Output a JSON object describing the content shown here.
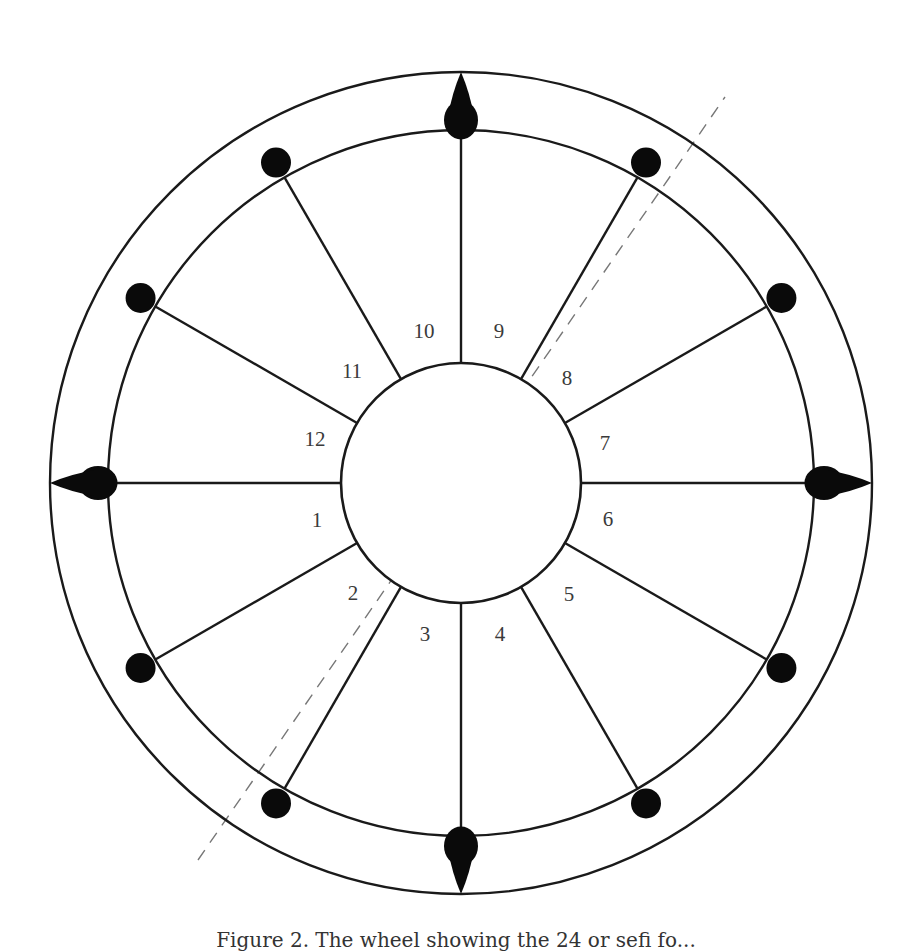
{
  "diagram": {
    "type": "wheel",
    "center": [
      461,
      483
    ],
    "outer_radius": 411,
    "inner_ring_radius": 353,
    "hub_radius": 120,
    "marker_radius": 370,
    "spoke_count": 12,
    "spoke_angles_deg": [
      0,
      30,
      60,
      90,
      120,
      150,
      180,
      210,
      240,
      270,
      300,
      330
    ],
    "line_color": "#1a1a1a",
    "marker_color": "#0a0a0a",
    "dashed_line": {
      "from": [
        198,
        860
      ],
      "to": [
        725,
        97
      ],
      "color": "#777777"
    },
    "cardinal_markers": [
      {
        "name": "top",
        "angle_deg": 90
      },
      {
        "name": "left",
        "angle_deg": 180
      },
      {
        "name": "bottom",
        "angle_deg": 270
      },
      {
        "name": "right",
        "angle_deg": 0
      }
    ],
    "round_markers_angles_deg": [
      30,
      60,
      120,
      150,
      210,
      240,
      300,
      330
    ],
    "houses": [
      {
        "label": "1",
        "pos": [
          317,
          520
        ]
      },
      {
        "label": "2",
        "pos": [
          353,
          593
        ]
      },
      {
        "label": "3",
        "pos": [
          425,
          634
        ]
      },
      {
        "label": "4",
        "pos": [
          500,
          634
        ]
      },
      {
        "label": "5",
        "pos": [
          569,
          594
        ]
      },
      {
        "label": "6",
        "pos": [
          608,
          519
        ]
      },
      {
        "label": "7",
        "pos": [
          605,
          443
        ]
      },
      {
        "label": "8",
        "pos": [
          567,
          378
        ]
      },
      {
        "label": "9",
        "pos": [
          499,
          331
        ]
      },
      {
        "label": "10",
        "pos": [
          424,
          331
        ]
      },
      {
        "label": "11",
        "pos": [
          352,
          371
        ]
      },
      {
        "label": "12",
        "pos": [
          315,
          439
        ]
      }
    ]
  },
  "caption": "Figure 2. The wheel showing the 24 or sefi fo..."
}
